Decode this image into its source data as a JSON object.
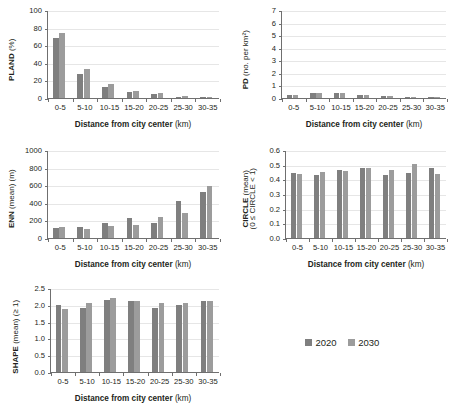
{
  "figure": {
    "categories": [
      "0-5",
      "5-10",
      "10-15",
      "15-20",
      "20-25",
      "25-30",
      "30-35"
    ],
    "xlabel_bold": "Distance from city center",
    "xlabel_unit": "(km)",
    "legend": {
      "entries": [
        {
          "label": "2020",
          "color": "#7f7f7f"
        },
        {
          "label": "2030",
          "color": "#9c9c9c"
        }
      ]
    }
  },
  "chart_data": [
    {
      "type": "bar",
      "id": "pland",
      "title": "",
      "ylabel_bold": "PLAND",
      "ylabel_unit": "(%)",
      "ylabel_line2": "",
      "xlabel": "Distance from city center (km)",
      "categories": [
        "0-5",
        "5-10",
        "10-15",
        "15-20",
        "20-25",
        "25-30",
        "30-35"
      ],
      "ylim": [
        0,
        100
      ],
      "yticks": [
        0,
        20,
        40,
        60,
        80,
        100
      ],
      "ytick_labels": [
        "0",
        "20",
        "40",
        "60",
        "80",
        "100"
      ],
      "grid": true,
      "series": [
        {
          "name": "2020",
          "values": [
            68,
            27.5,
            12.5,
            7,
            4.5,
            1.3,
            0.5
          ]
        },
        {
          "name": "2030",
          "values": [
            74,
            32.5,
            15.5,
            8.5,
            6,
            2,
            1.2
          ]
        }
      ]
    },
    {
      "type": "bar",
      "id": "pd",
      "title": "",
      "ylabel_bold": "PD",
      "ylabel_unit": "(no. per km²)",
      "ylabel_line2": "",
      "xlabel": "Distance from city center (km)",
      "categories": [
        "0-5",
        "5-10",
        "10-15",
        "15-20",
        "20-25",
        "25-30",
        "30-35"
      ],
      "ylim": [
        0,
        7
      ],
      "yticks": [
        0,
        1,
        2,
        3,
        4,
        5,
        6,
        7
      ],
      "ytick_labels": [
        "0",
        "1",
        "2",
        "3",
        "4",
        "5",
        "6",
        "7"
      ],
      "grid": true,
      "series": [
        {
          "name": "2020",
          "values": [
            0.22,
            0.38,
            0.36,
            0.22,
            0.17,
            0.1,
            0.04
          ]
        },
        {
          "name": "2030",
          "values": [
            0.23,
            0.42,
            0.4,
            0.23,
            0.18,
            0.11,
            0.05
          ]
        }
      ]
    },
    {
      "type": "bar",
      "id": "enn",
      "title": "",
      "ylabel_bold": "ENN",
      "ylabel_unit": "(mean) (m)",
      "ylabel_line2": "",
      "xlabel": "Distance from city center (km)",
      "categories": [
        "0-5",
        "5-10",
        "10-15",
        "15-20",
        "20-25",
        "25-30",
        "30-35"
      ],
      "ylim": [
        0,
        1000
      ],
      "yticks": [
        0,
        200,
        400,
        600,
        800,
        1000
      ],
      "ytick_labels": [
        "0",
        "200",
        "400",
        "600",
        "800",
        "1000"
      ],
      "grid": true,
      "series": [
        {
          "name": "2020",
          "values": [
            115,
            130,
            165,
            222,
            170,
            425,
            520
          ]
        },
        {
          "name": "2030",
          "values": [
            128,
            108,
            138,
            152,
            240,
            288,
            595
          ]
        }
      ]
    },
    {
      "type": "bar",
      "id": "circle",
      "title": "",
      "ylabel_bold": "CIRCLE",
      "ylabel_unit": "(mean)",
      "ylabel_line2": "(0 ≤ CIRCLE < 1)",
      "xlabel": "Distance from city center (km)",
      "categories": [
        "0-5",
        "5-10",
        "10-15",
        "15-20",
        "20-25",
        "25-30",
        "30-35"
      ],
      "ylim": [
        0,
        0.6
      ],
      "yticks": [
        0,
        0.1,
        0.2,
        0.3,
        0.4,
        0.5,
        0.6
      ],
      "ytick_labels": [
        "0.0",
        "0.1",
        "0.2",
        "0.3",
        "0.4",
        "0.5",
        "0.6"
      ],
      "grid": true,
      "series": [
        {
          "name": "2020",
          "values": [
            0.445,
            0.432,
            0.463,
            0.475,
            0.432,
            0.44,
            0.478
          ]
        },
        {
          "name": "2030",
          "values": [
            0.437,
            0.448,
            0.456,
            0.477,
            0.465,
            0.502,
            0.437
          ]
        }
      ]
    },
    {
      "type": "bar",
      "id": "shape",
      "title": "",
      "ylabel_bold": "SHAPE",
      "ylabel_unit": "(mean) (≥ 1)",
      "ylabel_line2": "",
      "xlabel": "Distance from city center (km)",
      "categories": [
        "0-5",
        "5-10",
        "10-15",
        "15-20",
        "20-25",
        "25-30",
        "30-35"
      ],
      "ylim": [
        0,
        2.5
      ],
      "yticks": [
        0,
        0.5,
        1.0,
        1.5,
        2.0,
        2.5
      ],
      "ytick_labels": [
        "0.0",
        "0.5",
        "1.0",
        "1.5",
        "2.0",
        "2.5"
      ],
      "grid": true,
      "series": [
        {
          "name": "2020",
          "values": [
            2.0,
            1.9,
            2.155,
            2.12,
            1.915,
            1.99,
            2.115
          ]
        },
        {
          "name": "2030",
          "values": [
            1.875,
            2.04,
            2.2,
            2.11,
            2.05,
            2.055,
            2.115
          ]
        }
      ]
    }
  ]
}
